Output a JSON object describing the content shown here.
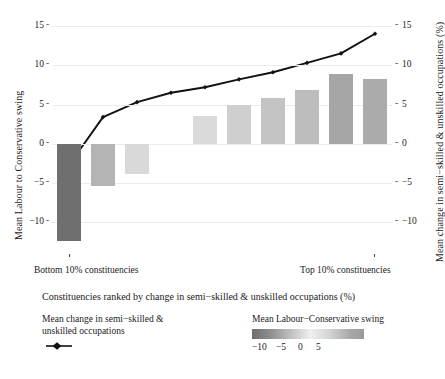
{
  "chart_data": {
    "type": "bar",
    "title": "",
    "subtitle": "",
    "xlabel": "Constituencies ranked by change in semi−skilled & unskilled occupations (%)",
    "ylabel_left": "Mean Labour to Conservative swing",
    "ylabel_right": "Mean change in semi−skilled & unskilled occupations (%)",
    "ylim": [
      -13.5,
      16.0
    ],
    "yticks": [
      15,
      10,
      5,
      0,
      -5,
      -10
    ],
    "ytick_labels": [
      "15",
      "10",
      "5",
      "0",
      "−5",
      "−10"
    ],
    "ytick_labels_right": [
      "15",
      "10",
      "5",
      "0",
      "−5",
      "−10"
    ],
    "grid": true,
    "legend_position": "below-plot",
    "categories": [
      "1",
      "2",
      "3",
      "4",
      "5",
      "6",
      "7",
      "8",
      "9",
      "10"
    ],
    "x_annotation_left": "Bottom 10% constituencies",
    "x_annotation_right": "Top 10% constituencies",
    "series": [
      {
        "name": "Mean Labour to Conservative swing",
        "type": "bar",
        "values": [
          -12.3,
          -5.4,
          -3.9,
          0.0,
          3.6,
          5.0,
          5.8,
          6.8,
          8.9,
          8.3
        ],
        "colors": [
          "#6f6f6f",
          "#b4b4b4",
          "#d9d9d9",
          "#f4f4f4",
          "#dadada",
          "#cfcfcf",
          "#c4c4c4",
          "#bdbdbd",
          "#a6a6a6",
          "#ababab"
        ]
      },
      {
        "name": "Mean change in semi−skilled & unskilled occupations",
        "type": "line",
        "values": [
          -2.7,
          3.4,
          5.3,
          6.5,
          7.2,
          8.2,
          9.1,
          10.3,
          11.5,
          14.0
        ],
        "color": "#111111",
        "marker": "diamond"
      }
    ]
  },
  "legends": {
    "line_legend": {
      "title_line1": "Mean change in semi−skilled &",
      "title_line2": "unskilled occupations",
      "key_name": "line-with-point-marker"
    },
    "colorbar_legend": {
      "title": "Mean Labour−Conservative swing",
      "ticks": [
        "−10",
        "−5",
        "0",
        "5"
      ],
      "gradient_from": "#6e6e6e",
      "gradient_mid": "#efefef",
      "gradient_to": "#9a9a9a"
    }
  },
  "colors": {
    "background": "#ffffff",
    "grid": "#eceaea",
    "text": "#1a1a1a",
    "line": "#111111"
  }
}
